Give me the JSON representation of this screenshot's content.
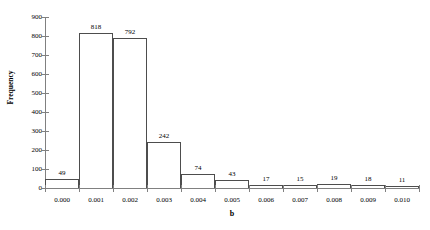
{
  "chart_data": {
    "type": "bar",
    "title": "",
    "xlabel": "b",
    "ylabel": "Frequency",
    "categories": [
      "0.000",
      "0.001",
      "0.002",
      "0.003",
      "0.004",
      "0.005",
      "0.006",
      "0.007",
      "0.008",
      "0.009",
      "0.010"
    ],
    "values": [
      49,
      818,
      792,
      242,
      74,
      43,
      17,
      15,
      19,
      18,
      11
    ],
    "bar_labels": [
      "49",
      "818",
      "792",
      "242",
      "74",
      "43",
      "17",
      "15",
      "19",
      "18",
      "11"
    ],
    "ylim": [
      0,
      900
    ],
    "y_ticks": [
      0,
      100,
      200,
      300,
      400,
      500,
      600,
      700,
      800,
      900
    ],
    "y_tick_labels": [
      "0",
      "100",
      "200",
      "300",
      "400",
      "500",
      "600",
      "700",
      "800",
      "900"
    ],
    "x_tick_labels": [
      "0.000",
      "0.001",
      "0.002",
      "0.003",
      "0.004",
      "0.005",
      "0.006",
      "0.007",
      "0.008",
      "0.009",
      "0.010"
    ],
    "grid": false,
    "legend": "none",
    "bar_edge_color": "#4d4d4d",
    "bar_fill_color": "#ffffff",
    "axis_color": "#808080",
    "background_color": "#ffffff"
  }
}
